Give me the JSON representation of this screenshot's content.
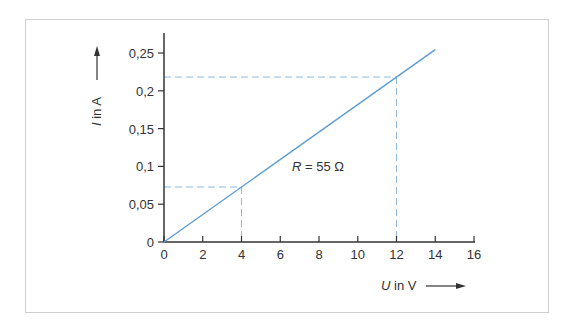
{
  "chart_data": {
    "type": "line",
    "title": "",
    "xlabel": "U in V",
    "ylabel": "I in A",
    "xlabel_var": "U",
    "xlabel_unit": " in V",
    "ylabel_var": "I",
    "ylabel_unit": " in A",
    "xlim": [
      0,
      16
    ],
    "ylim": [
      0,
      0.25
    ],
    "x_ticks": [
      "0",
      "2",
      "4",
      "6",
      "8",
      "10",
      "12",
      "14",
      "16"
    ],
    "y_ticks": [
      "0",
      "0,05",
      "0,1",
      "0,15",
      "0,2",
      "0,25"
    ],
    "grid": false,
    "series": [
      {
        "name": "R = 55 Ω",
        "x": [
          0,
          14
        ],
        "y": [
          0,
          0.2545
        ],
        "color": "#5b9bd5"
      }
    ],
    "guide_points": [
      {
        "x": 4,
        "y": 0.0727
      },
      {
        "x": 12,
        "y": 0.2182
      }
    ],
    "annotations": [
      {
        "text": "R = 55 Ω",
        "var": "R",
        "rest": " = 55 Ω",
        "x": 6.8,
        "y": 0.095
      }
    ],
    "colors": {
      "line": "#5b9bd5",
      "guide": "#8fb8dd",
      "axis": "#333333",
      "frame": "#cfcfcf"
    }
  }
}
